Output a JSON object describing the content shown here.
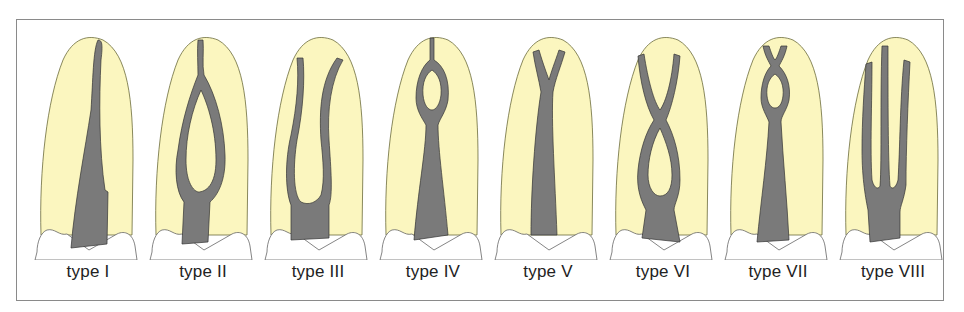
{
  "figure": {
    "colors": {
      "root": "#fbf6bf",
      "canal": "#7a7a7a",
      "frame": "#8a8a8a",
      "label": "#222222"
    },
    "types": [
      {
        "id": "I",
        "label": "type I",
        "description": "single canal from orifice to apex"
      },
      {
        "id": "II",
        "label": "type II",
        "description": "two canals leaving chamber, merging short of apex"
      },
      {
        "id": "III",
        "label": "type III",
        "description": "one canal dividing into two, exiting separately"
      },
      {
        "id": "IV",
        "label": "type IV",
        "description": "one canal dividing then rejoining to one"
      },
      {
        "id": "V",
        "label": "type V",
        "description": "one canal dividing into two near apex"
      },
      {
        "id": "VI",
        "label": "type VI",
        "description": "two canals merging then dividing again"
      },
      {
        "id": "VII",
        "label": "type VII",
        "description": "one canal dividing, rejoining, dividing again"
      },
      {
        "id": "VIII",
        "label": "type VIII",
        "description": "three separate canals"
      }
    ]
  }
}
